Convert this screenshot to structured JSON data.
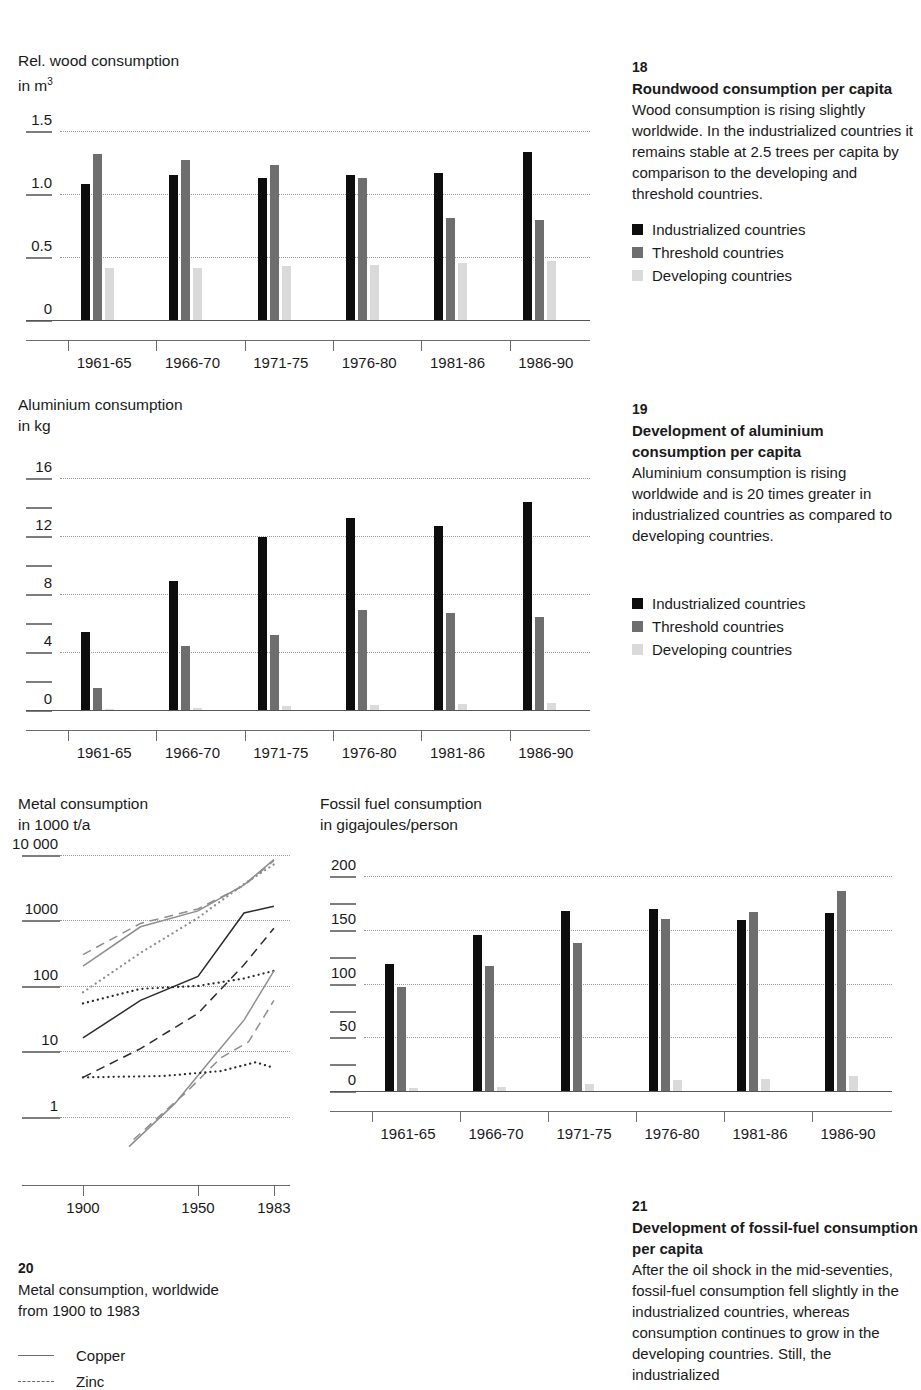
{
  "palette": {
    "industrialized": "#0d0d0d",
    "threshold": "#6e6e6e",
    "developing": "#dadada",
    "grid": "#9a9a9a",
    "axis": "#6a6b6e"
  },
  "legend_common": [
    {
      "label": "Industrialized countries",
      "key": "industrialized"
    },
    {
      "label": "Threshold countries",
      "key": "threshold"
    },
    {
      "label": "Developing countries",
      "key": "developing"
    }
  ],
  "panel18": {
    "number": "18",
    "heading": "Roundwood consumption per capita",
    "body": "Wood consumption is rising slightly worldwide. In the industrialized countries it remains stable at 2.5 trees per capita by comparison to the developing and threshold countries.",
    "legend": [
      {
        "label": "Industrialized countries"
      },
      {
        "label": "Threshold countries"
      },
      {
        "label": "Developing countries"
      }
    ]
  },
  "panel19": {
    "number": "19",
    "heading": "Development of aluminium consumption per capita",
    "body": "Aluminium consumption is rising worldwide and is 20 times greater in industrialized countries as compared to developing countries.",
    "legend": [
      {
        "label": "Industrialized countries"
      },
      {
        "label": "Threshold countries"
      },
      {
        "label": "Developing countries"
      }
    ]
  },
  "panel20": {
    "number": "20",
    "body_line1": "Metal consumption, worldwide",
    "body_line2": "from 1900 to 1983",
    "legend": [
      {
        "label": "Copper"
      },
      {
        "label": "Zinc"
      }
    ]
  },
  "panel21": {
    "number": "21",
    "heading": "Development of fossil-fuel consumption per capita",
    "body": "After the oil shock in the mid-seventies, fossil-fuel consumption fell slightly in the industrialized countries, whereas consumption continues to grow in the developing countries. Still, the industrialized"
  },
  "chart_data": [
    {
      "id": "wood",
      "type": "bar",
      "title": "Rel. wood consumption",
      "subtitle": "in m3",
      "ylabel_line1": "Rel. wood consumption",
      "ylabel_line2_prefix": "in m",
      "ylabel_line2_sup": "3",
      "xlabel": "",
      "ylim": [
        0,
        1.65
      ],
      "yticks": [
        0,
        0.5,
        1.0,
        1.5
      ],
      "ytick_labels": [
        "0",
        "0.5",
        "1.0",
        "1.5"
      ],
      "gridlines": [
        0.5,
        1.0,
        1.5
      ],
      "grid": true,
      "categories": [
        "1961-65",
        "1966-70",
        "1971-75",
        "1976-80",
        "1981-86",
        "1986-90"
      ],
      "series": [
        {
          "name": "Industrialized countries",
          "key": "industrialized",
          "values": [
            1.08,
            1.15,
            1.13,
            1.15,
            1.17,
            1.33
          ]
        },
        {
          "name": "Threshold countries",
          "key": "threshold",
          "values": [
            1.32,
            1.27,
            1.23,
            1.13,
            0.81,
            0.79
          ]
        },
        {
          "name": "Developing countries",
          "key": "developing",
          "values": [
            0.41,
            0.41,
            0.43,
            0.44,
            0.45,
            0.47
          ]
        }
      ]
    },
    {
      "id": "aluminium",
      "type": "bar",
      "title": "Aluminium consumption",
      "subtitle": "in kg",
      "ylabel_line1": "Aluminium consumption",
      "ylabel_line2_prefix": "in kg",
      "ylabel_line2_sup": "",
      "ylim": [
        0,
        17.5
      ],
      "yticks": [
        0,
        2,
        4,
        6,
        8,
        10,
        12,
        14,
        16
      ],
      "ytick_labels": [
        "0",
        "",
        "4",
        "",
        "8",
        "",
        "12",
        "",
        "16"
      ],
      "gridlines": [
        4,
        8,
        12,
        16
      ],
      "grid": true,
      "categories": [
        "1961-65",
        "1966-70",
        "1971-75",
        "1976-80",
        "1981-86",
        "1986-90"
      ],
      "series": [
        {
          "name": "Industrialized countries",
          "key": "industrialized",
          "values": [
            5.4,
            8.9,
            11.9,
            13.2,
            12.7,
            14.3
          ]
        },
        {
          "name": "Threshold countries",
          "key": "threshold",
          "values": [
            1.5,
            4.4,
            5.2,
            6.9,
            6.7,
            6.4
          ]
        },
        {
          "name": "Developing countries",
          "key": "developing",
          "values": [
            0.1,
            0.15,
            0.25,
            0.35,
            0.4,
            0.45
          ]
        }
      ]
    },
    {
      "id": "metal",
      "type": "line",
      "title": "Metal consumption",
      "subtitle": "in 1000 t/a",
      "ylabel_line1": "Metal consumption",
      "ylabel_line2_prefix": "in 1000 t/a",
      "ylabel_line2_sup": "",
      "yscale": "log",
      "ylim": [
        0.3,
        10000
      ],
      "yticks": [
        1,
        10,
        100,
        1000,
        10000
      ],
      "ytick_labels": [
        "1",
        "10",
        "100",
        "1000",
        "10 000"
      ],
      "gridlines": [
        1,
        10,
        100,
        1000,
        10000
      ],
      "grid": true,
      "xticks": [
        1900,
        1950,
        1983
      ],
      "xtick_labels": [
        "1900",
        "1950",
        "1983"
      ],
      "xlim": [
        1890,
        1990
      ],
      "series": [
        {
          "name": "Copper",
          "style": "solid",
          "color": "#2b2b2b",
          "x": [
            1900,
            1925,
            1950,
            1970,
            1983
          ],
          "y": [
            16,
            60,
            140,
            1300,
            1650
          ]
        },
        {
          "name": "Zinc",
          "style": "dashed",
          "color": "#2b2b2b",
          "x": [
            1900,
            1925,
            1950,
            1970,
            1983
          ],
          "y": [
            4.0,
            11,
            38,
            210,
            760
          ]
        },
        {
          "name": "Series 3",
          "style": "dotted",
          "color": "#2b2b2b",
          "x": [
            1900,
            1925,
            1950,
            1970,
            1983
          ],
          "y": [
            54,
            90,
            100,
            130,
            170
          ]
        },
        {
          "name": "Series 4",
          "style": "solid",
          "color": "#8e8e8e",
          "x": [
            1900,
            1925,
            1950,
            1970,
            1983
          ],
          "y": [
            200,
            800,
            1400,
            3500,
            8500
          ]
        },
        {
          "name": "Series 5",
          "style": "dashed",
          "color": "#8e8e8e",
          "x": [
            1900,
            1925,
            1950,
            1970,
            1983
          ],
          "y": [
            300,
            900,
            1500,
            3400,
            8200
          ]
        },
        {
          "name": "Series 6",
          "style": "dotted",
          "color": "#8e8e8e",
          "x": [
            1900,
            1925,
            1950,
            1970,
            1983
          ],
          "y": [
            80,
            320,
            1100,
            3600,
            7200
          ]
        },
        {
          "name": "Series 7",
          "style": "solid",
          "color": "#8e8e8e",
          "x": [
            1920,
            1940,
            1955,
            1970,
            1983
          ],
          "y": [
            0.35,
            1.6,
            7.0,
            30,
            170
          ]
        },
        {
          "name": "Series 8",
          "style": "dashed",
          "color": "#8e8e8e",
          "x": [
            1922,
            1945,
            1960,
            1972,
            1983
          ],
          "y": [
            0.45,
            2.4,
            8.0,
            14,
            60
          ]
        },
        {
          "name": "Series 9",
          "style": "dotted",
          "color": "#2b2b2b",
          "x": [
            1900,
            1935,
            1960,
            1975,
            1983
          ],
          "y": [
            4.0,
            4.2,
            5.0,
            6.8,
            5.6
          ]
        }
      ]
    },
    {
      "id": "fossil",
      "type": "bar",
      "title": "Fossil fuel consumption",
      "subtitle": "in gigajoules/person",
      "ylabel_line1": "Fossil fuel consumption",
      "ylabel_line2_prefix": "in gigajoules/person",
      "ylabel_line2_sup": "",
      "ylim": [
        0,
        220
      ],
      "yticks": [
        0,
        25,
        50,
        75,
        100,
        125,
        150,
        175,
        200
      ],
      "ytick_labels": [
        "0",
        "",
        "50",
        "",
        "100",
        "",
        "150",
        "",
        "200"
      ],
      "gridlines": [
        50,
        100,
        150,
        200
      ],
      "grid": true,
      "categories": [
        "1961-65",
        "1966-70",
        "1971-75",
        "1976-80",
        "1981-86",
        "1986-90"
      ],
      "series": [
        {
          "name": "Industrialized countries",
          "key": "industrialized",
          "values": [
            118,
            145,
            168,
            170,
            159,
            166
          ]
        },
        {
          "name": "Threshold countries",
          "key": "threshold",
          "values": [
            97,
            117,
            138,
            160,
            167,
            186
          ]
        },
        {
          "name": "Developing countries",
          "key": "developing",
          "values": [
            3,
            4,
            7,
            10,
            11,
            14
          ]
        }
      ]
    }
  ]
}
